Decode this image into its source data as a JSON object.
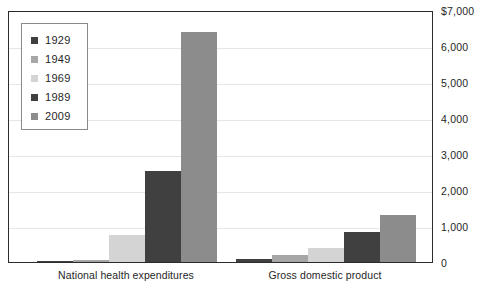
{
  "chart_data": {
    "type": "bar",
    "title": "",
    "subtitle": "",
    "xlabel": "",
    "ylabel": "",
    "categories": [
      "National health expenditures",
      "Gross domestic product"
    ],
    "series": [
      {
        "name": "1929",
        "color": "#3f3f3f",
        "values": [
          3,
          103
        ]
      },
      {
        "name": "1949",
        "color": "#a6a6a6",
        "values": [
          12,
          267
        ]
      },
      {
        "name": "1969",
        "color": "#d4d4d4",
        "values": [
          63,
          1038
        ]
      },
      {
        "name": "1989",
        "color": "#404040",
        "values": [
          604,
          5482
        ]
      },
      {
        "name": "2009",
        "color": "#8c8c8c",
        "values": [
          2486,
          14119
        ]
      }
    ],
    "plotted_values": {
      "National health expenditures": [
        30,
        60,
        760,
        2530,
        6400
      ],
      "Gross domestic product": [
        80,
        190,
        380,
        830,
        1300
      ]
    },
    "ylim": [
      0,
      7000
    ],
    "yticks": [
      0,
      1000,
      2000,
      3000,
      4000,
      5000,
      6000,
      7000
    ],
    "ytick_labels": [
      "0",
      "1,000",
      "2,000",
      "3,000",
      "4,000",
      "5,000",
      "6,000",
      "$7,000"
    ],
    "grid": true,
    "legend_position": "top-left",
    "legend_entries": [
      "1929",
      "1949",
      "1969",
      "1989",
      "2009"
    ]
  },
  "axis": {
    "y_tick_labels": [
      "$7,000",
      "6,000",
      "5,000",
      "4,000",
      "3,000",
      "2,000",
      "1,000",
      "0"
    ],
    "x_category_labels": [
      "National health expenditures",
      "Gross domestic product"
    ]
  },
  "legend": {
    "items": [
      {
        "label": "1929",
        "color": "#3f3f3f"
      },
      {
        "label": "1949",
        "color": "#a6a6a6"
      },
      {
        "label": "1969",
        "color": "#d4d4d4"
      },
      {
        "label": "1989",
        "color": "#404040"
      },
      {
        "label": "2009",
        "color": "#8c8c8c"
      }
    ]
  },
  "style": {
    "frame_color": "#2b2b2b",
    "grid_color": "#e6e6e6",
    "background": "#ffffff",
    "text_color": "#262626"
  }
}
